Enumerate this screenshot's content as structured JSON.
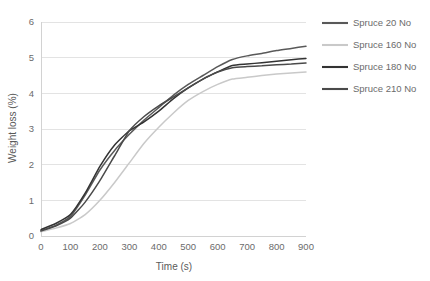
{
  "chart_data": {
    "type": "line",
    "title": "",
    "xlabel": "Time (s)",
    "ylabel": "Weight loss (%)",
    "xlim": [
      0,
      900
    ],
    "ylim": [
      0,
      6
    ],
    "xticks": [
      0,
      100,
      200,
      300,
      400,
      500,
      600,
      700,
      800,
      900
    ],
    "yticks": [
      0,
      1,
      2,
      3,
      4,
      5,
      6
    ],
    "xtick_labels": [
      "0",
      "100",
      "200",
      "300",
      "400",
      "500",
      "600",
      "700",
      "800",
      "900"
    ],
    "ytick_labels": [
      "0",
      "1",
      "2",
      "3",
      "4",
      "5",
      "6"
    ],
    "grid": "horizontal",
    "legend_position": "right",
    "x": [
      0,
      50,
      100,
      150,
      200,
      250,
      300,
      350,
      400,
      450,
      500,
      550,
      600,
      650,
      700,
      750,
      800,
      850,
      900
    ],
    "series": [
      {
        "name": "Spruce 20 No",
        "color": "#595959",
        "values": [
          0.15,
          0.3,
          0.55,
          1.15,
          1.85,
          2.4,
          2.85,
          3.25,
          3.6,
          3.95,
          4.25,
          4.5,
          4.75,
          4.95,
          5.05,
          5.12,
          5.2,
          5.26,
          5.32
        ]
      },
      {
        "name": "Spruce 160 No",
        "color": "#c9c9c9",
        "values": [
          0.12,
          0.22,
          0.35,
          0.6,
          1.0,
          1.5,
          2.05,
          2.6,
          3.05,
          3.45,
          3.8,
          4.05,
          4.25,
          4.4,
          4.45,
          4.5,
          4.54,
          4.57,
          4.6
        ]
      },
      {
        "name": "Spruce 180 No",
        "color": "#333333",
        "values": [
          0.18,
          0.35,
          0.6,
          1.2,
          1.95,
          2.55,
          2.95,
          3.2,
          3.5,
          3.85,
          4.15,
          4.4,
          4.6,
          4.78,
          4.82,
          4.86,
          4.9,
          4.94,
          4.98
        ]
      },
      {
        "name": "Spruce 210 No",
        "color": "#4a4a4a",
        "values": [
          0.14,
          0.28,
          0.5,
          0.95,
          1.55,
          2.25,
          2.95,
          3.35,
          3.65,
          3.9,
          4.15,
          4.4,
          4.6,
          4.72,
          4.75,
          4.77,
          4.8,
          4.82,
          4.85
        ]
      }
    ]
  },
  "legend": {
    "items": [
      {
        "label": "Spruce 20 No",
        "color": "#595959"
      },
      {
        "label": "Spruce 160 No",
        "color": "#c9c9c9"
      },
      {
        "label": "Spruce 180 No",
        "color": "#333333"
      },
      {
        "label": "Spruce 210 No",
        "color": "#4a4a4a"
      }
    ]
  },
  "style": {
    "background": "#ffffff",
    "gridline_color": "#e3e3e3",
    "axis_color": "#d2d2d2",
    "text_color": "#6b6b6b"
  }
}
